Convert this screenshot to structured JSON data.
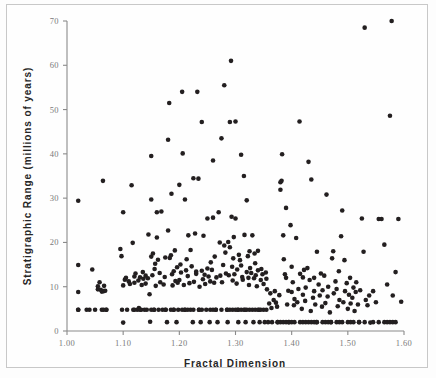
{
  "figure": {
    "background": "#ffffff",
    "frame_color": "#c8c8c8",
    "point_color": "#231f20",
    "axis_color": "#8a8a8a"
  },
  "chart_data": {
    "type": "scatter",
    "title": "",
    "xlabel": "Fractal Dimension",
    "ylabel": "Stratigraphic Range (millions of years)",
    "xlim": [
      1.0,
      1.6
    ],
    "ylim": [
      0,
      70
    ],
    "xticks": [
      1.0,
      1.1,
      1.2,
      1.3,
      1.4,
      1.5,
      1.6
    ],
    "xticklabels": [
      "1.00",
      "1.10",
      "1.20",
      "1.30",
      "1.40",
      "1.50",
      "1.60"
    ],
    "yticks": [
      0,
      10,
      20,
      30,
      40,
      50,
      60,
      70
    ],
    "yticklabels": [
      "0",
      "10",
      "20",
      "30",
      "40",
      "50",
      "60",
      "70"
    ],
    "grid": false,
    "legend": false,
    "marker": "circle",
    "marker_size": 4.6,
    "series": [
      {
        "name": "taxa",
        "x": [
          1.02,
          1.02,
          1.02,
          1.02,
          1.035,
          1.04,
          1.045,
          1.05,
          1.055,
          1.055,
          1.058,
          1.06,
          1.062,
          1.062,
          1.064,
          1.065,
          1.066,
          1.068,
          1.07,
          1.07,
          1.095,
          1.097,
          1.098,
          1.1,
          1.1,
          1.1,
          1.103,
          1.105,
          1.107,
          1.11,
          1.112,
          1.115,
          1.117,
          1.118,
          1.12,
          1.12,
          1.122,
          1.125,
          1.127,
          1.128,
          1.13,
          1.132,
          1.133,
          1.135,
          1.136,
          1.138,
          1.14,
          1.14,
          1.142,
          1.144,
          1.145,
          1.147,
          1.148,
          1.15,
          1.15,
          1.15,
          1.152,
          1.153,
          1.155,
          1.156,
          1.157,
          1.158,
          1.16,
          1.16,
          1.162,
          1.163,
          1.165,
          1.166,
          1.168,
          1.17,
          1.172,
          1.174,
          1.175,
          1.176,
          1.178,
          1.18,
          1.18,
          1.182,
          1.183,
          1.185,
          1.186,
          1.187,
          1.188,
          1.19,
          1.19,
          1.192,
          1.193,
          1.195,
          1.196,
          1.197,
          1.198,
          1.2,
          1.2,
          1.202,
          1.203,
          1.205,
          1.206,
          1.208,
          1.21,
          1.21,
          1.212,
          1.213,
          1.215,
          1.216,
          1.218,
          1.22,
          1.22,
          1.222,
          1.224,
          1.225,
          1.226,
          1.228,
          1.23,
          1.23,
          1.232,
          1.234,
          1.235,
          1.236,
          1.238,
          1.24,
          1.24,
          1.242,
          1.243,
          1.245,
          1.246,
          1.248,
          1.25,
          1.25,
          1.252,
          1.254,
          1.255,
          1.256,
          1.258,
          1.26,
          1.26,
          1.262,
          1.263,
          1.265,
          1.266,
          1.268,
          1.27,
          1.272,
          1.273,
          1.275,
          1.276,
          1.278,
          1.28,
          1.28,
          1.282,
          1.283,
          1.285,
          1.286,
          1.287,
          1.288,
          1.29,
          1.29,
          1.292,
          1.293,
          1.294,
          1.295,
          1.296,
          1.297,
          1.298,
          1.3,
          1.3,
          1.302,
          1.303,
          1.304,
          1.305,
          1.306,
          1.308,
          1.31,
          1.31,
          1.312,
          1.313,
          1.315,
          1.316,
          1.317,
          1.318,
          1.32,
          1.32,
          1.322,
          1.323,
          1.324,
          1.325,
          1.326,
          1.328,
          1.33,
          1.33,
          1.332,
          1.333,
          1.334,
          1.335,
          1.336,
          1.338,
          1.34,
          1.34,
          1.342,
          1.343,
          1.345,
          1.346,
          1.348,
          1.35,
          1.35,
          1.352,
          1.354,
          1.355,
          1.356,
          1.358,
          1.36,
          1.362,
          1.364,
          1.365,
          1.368,
          1.37,
          1.372,
          1.374,
          1.375,
          1.378,
          1.38,
          1.38,
          1.382,
          1.383,
          1.385,
          1.386,
          1.388,
          1.39,
          1.39,
          1.392,
          1.394,
          1.395,
          1.398,
          1.4,
          1.4,
          1.402,
          1.404,
          1.405,
          1.408,
          1.41,
          1.412,
          1.414,
          1.415,
          1.418,
          1.42,
          1.42,
          1.422,
          1.424,
          1.425,
          1.428,
          1.43,
          1.432,
          1.434,
          1.435,
          1.438,
          1.44,
          1.44,
          1.442,
          1.444,
          1.445,
          1.448,
          1.45,
          1.452,
          1.454,
          1.455,
          1.458,
          1.46,
          1.462,
          1.464,
          1.465,
          1.468,
          1.47,
          1.472,
          1.474,
          1.475,
          1.478,
          1.48,
          1.482,
          1.484,
          1.485,
          1.488,
          1.49,
          1.492,
          1.494,
          1.495,
          1.498,
          1.5,
          1.502,
          1.504,
          1.505,
          1.508,
          1.51,
          1.512,
          1.514,
          1.515,
          1.518,
          1.52,
          1.522,
          1.525,
          1.528,
          1.53,
          1.532,
          1.535,
          1.538,
          1.54,
          1.545,
          1.55,
          1.555,
          1.56,
          1.565,
          1.57,
          1.575,
          1.578,
          1.58,
          1.585,
          1.59,
          1.595,
          1.02,
          1.065,
          1.12,
          1.13,
          1.15,
          1.155,
          1.175,
          1.185,
          1.19,
          1.205,
          1.21,
          1.215,
          1.225,
          1.235,
          1.24,
          1.255,
          1.26,
          1.265,
          1.275,
          1.285,
          1.29,
          1.295,
          1.3,
          1.305,
          1.31,
          1.315,
          1.32,
          1.325,
          1.335,
          1.34,
          1.345,
          1.355,
          1.375,
          1.38,
          1.385,
          1.39,
          1.395,
          1.4,
          1.405,
          1.415,
          1.42,
          1.425,
          1.43,
          1.435,
          1.44,
          1.445,
          1.455,
          1.46,
          1.465,
          1.47,
          1.48,
          1.485,
          1.49,
          1.5,
          1.505,
          1.51,
          1.52,
          1.53,
          1.545,
          1.555,
          1.565,
          1.57,
          1.575,
          1.58,
          1.585
        ],
        "y": [
          29.4,
          14.9,
          8.8,
          4.8,
          4.8,
          4.8,
          13.9,
          4.8,
          9.4,
          10.1,
          11.0,
          9.3,
          8.9,
          4.8,
          33.9,
          9.0,
          10.2,
          9.1,
          4.8,
          4.8,
          18.5,
          16.9,
          4.8,
          1.9,
          10.3,
          26.8,
          11.6,
          12.0,
          4.8,
          11.2,
          10.6,
          32.9,
          19.9,
          4.8,
          12.3,
          10.9,
          13.0,
          4.8,
          11.4,
          5.2,
          12.1,
          4.8,
          10.4,
          13.3,
          11.8,
          4.8,
          12.5,
          10.7,
          4.8,
          11.9,
          21.8,
          8.3,
          2.1,
          39.5,
          29.7,
          16.8,
          12.6,
          17.5,
          4.8,
          14.0,
          15.2,
          10.2,
          21.1,
          26.8,
          16.1,
          4.8,
          13.1,
          11.0,
          27.0,
          4.8,
          10.5,
          12.2,
          16.6,
          4.8,
          2.0,
          43.2,
          22.7,
          51.5,
          16.5,
          17.1,
          31.0,
          12.8,
          10.3,
          13.5,
          4.8,
          18.2,
          11.3,
          2.0,
          14.4,
          10.9,
          4.8,
          33.0,
          11.5,
          15.0,
          13.2,
          54.0,
          40.1,
          10.4,
          29.7,
          4.8,
          13.7,
          16.2,
          12.4,
          21.6,
          10.8,
          18.3,
          4.8,
          14.6,
          2.0,
          34.5,
          11.1,
          22.0,
          12.9,
          13.4,
          54.0,
          34.4,
          4.8,
          10.0,
          2.0,
          47.2,
          13.6,
          11.7,
          21.5,
          12.7,
          10.6,
          4.8,
          25.4,
          14.1,
          12.3,
          2.0,
          11.2,
          15.5,
          13.8,
          38.5,
          25.6,
          10.9,
          16.8,
          4.8,
          12.1,
          2.0,
          26.8,
          20.0,
          12.5,
          43.5,
          11.0,
          14.9,
          55.5,
          19.3,
          17.7,
          13.0,
          4.8,
          2.0,
          20.1,
          12.6,
          18.9,
          47.2,
          61.0,
          25.8,
          14.5,
          11.4,
          16.4,
          21.2,
          12.8,
          47.3,
          25.4,
          10.7,
          13.9,
          4.8,
          2.0,
          17.2,
          16.0,
          14.8,
          39.8,
          12.2,
          11.6,
          35.0,
          21.7,
          4.8,
          2.0,
          13.3,
          29.5,
          16.9,
          12.0,
          10.4,
          18.0,
          14.2,
          13.1,
          21.6,
          4.8,
          2.0,
          11.9,
          17.5,
          15.3,
          12.6,
          10.1,
          13.7,
          18.1,
          4.8,
          2.0,
          11.5,
          14.0,
          12.8,
          10.6,
          4.8,
          2.0,
          13.2,
          11.8,
          9.4,
          2.0,
          6.2,
          8.5,
          5.2,
          2.0,
          7.0,
          9.0,
          6.4,
          5.5,
          2.0,
          8.1,
          31.9,
          33.6,
          33.9,
          39.9,
          21.6,
          16.2,
          12.8,
          27.8,
          12.0,
          6.0,
          9.1,
          2.0,
          23.9,
          14.5,
          8.8,
          11.0,
          5.8,
          7.2,
          21.0,
          6.5,
          9.5,
          47.3,
          12.9,
          5.0,
          8.2,
          12.1,
          13.8,
          6.8,
          9.8,
          14.2,
          38.2,
          11.5,
          4.5,
          34.2,
          7.5,
          9.0,
          12.0,
          6.0,
          2.0,
          17.9,
          10.5,
          8.0,
          13.0,
          5.5,
          9.2,
          12.5,
          6.3,
          30.8,
          7.8,
          10.0,
          4.2,
          2.0,
          16.4,
          18.0,
          8.5,
          11.2,
          9.5,
          5.6,
          13.5,
          7.0,
          21.4,
          27.2,
          6.5,
          16.0,
          9.0,
          10.8,
          5.0,
          8.2,
          12.0,
          6.2,
          7.5,
          9.8,
          4.5,
          8.8,
          11.0,
          6.0,
          2.0,
          9.2,
          25.4,
          17.9,
          68.5,
          7.0,
          5.8,
          8.0,
          1.9,
          9.0,
          6.5,
          25.3,
          25.3,
          19.5,
          10.5,
          48.6,
          70.0,
          8.0,
          13.3,
          25.3,
          6.6,
          4.8,
          4.8,
          4.8,
          4.8,
          4.8,
          4.8,
          4.8,
          4.8,
          4.8,
          4.8,
          4.8,
          4.8,
          4.8,
          4.8,
          4.8,
          4.8,
          4.8,
          4.8,
          4.8,
          4.8,
          4.8,
          4.8,
          4.8,
          4.8,
          4.8,
          4.8,
          4.8,
          4.8,
          4.8,
          4.8,
          4.8,
          4.8,
          2.0,
          2.0,
          2.0,
          2.0,
          2.0,
          2.0,
          2.0,
          2.0,
          2.0,
          2.0,
          2.0,
          2.0,
          2.0,
          2.0,
          2.0,
          2.0,
          2.0,
          2.0,
          2.0,
          2.0,
          2.0,
          2.0,
          2.0,
          2.0,
          2.0,
          2.0,
          2.0,
          2.0,
          2.0,
          2.0,
          2.0,
          2.0,
          2.0
        ]
      }
    ]
  }
}
